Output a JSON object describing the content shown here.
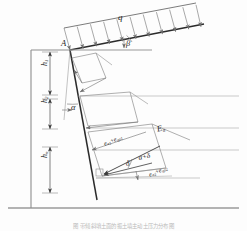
{
  "figure": {
    "caption": "图  带倾斜填土面的振土墙主动土压力分布图"
  },
  "labels": {
    "surcharge": "q",
    "slope_angle": "β",
    "wall_angle": "α",
    "friction_angle": "δ",
    "resultant_angle": "α+δ",
    "apex_point": "A",
    "height_1": {
      "base": "h",
      "sub": "1"
    },
    "height_2": {
      "base": "h",
      "sub": "2"
    },
    "height_n": {
      "base": "h",
      "sub": "n"
    },
    "resultant_force": {
      "base": "E",
      "sub": "a"
    },
    "pressure_upper": {
      "t1": "e",
      "s1": "a1",
      "op": "+",
      "t2": "e",
      "s2": "qa1"
    },
    "pressure_lower": {
      "t1": "e",
      "s1": "a2",
      "op": "+",
      "t2": "e",
      "s2": "qa2"
    }
  },
  "geometry": {
    "wall_face_top": {
      "x": 70,
      "y": 50
    },
    "wall_face_bottom": {
      "x": 97,
      "y": 196
    },
    "wall_front_x": 31,
    "ground_line_y": 208,
    "slope_start": {
      "x": 70,
      "y": 50
    },
    "slope_end": {
      "x": 200,
      "y": 25
    },
    "surcharge_arrow_count": 11,
    "layer_line_count": 4,
    "wedge_count": 3
  },
  "colors": {
    "ink": "#2b2b2b",
    "thin": "#8d8d8d",
    "faint": "#b4b4b4",
    "caption": "#bdbdbd",
    "background": "#ffffff"
  }
}
